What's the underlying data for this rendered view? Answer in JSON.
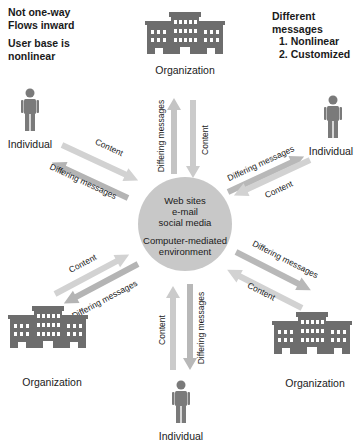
{
  "notes": {
    "left": [
      "Not one-way",
      "Flows inward",
      "User base is",
      "nonlinear"
    ],
    "right": {
      "title": "Different messages",
      "items": [
        "1. Nonlinear",
        "2. Customized"
      ]
    }
  },
  "hub": {
    "lines": [
      "Web sites",
      "e-mail",
      "social media"
    ],
    "caption": [
      "Computer-mediated",
      "environment"
    ]
  },
  "nodes": {
    "top": "Organization",
    "upper_left": "Individual",
    "upper_right": "Individual",
    "lower_left": "Organization",
    "lower_right": "Organization",
    "bottom": "Individual"
  },
  "arrows": {
    "content": "Content",
    "differing": "Differing messages"
  },
  "colors": {
    "building": "#6d6d6d",
    "person": "#7a7a7a",
    "hub": "#c8c8c8",
    "arrow_light": "#d2d2d2",
    "arrow_dark": "#b4b4b4",
    "text": "#1a1a1a"
  }
}
